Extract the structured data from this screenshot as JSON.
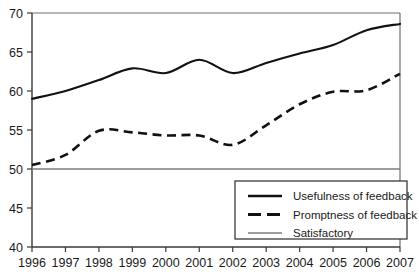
{
  "chart_data": {
    "type": "line",
    "title": "",
    "xlabel": "",
    "ylabel": "",
    "x": [
      1996,
      1997,
      1998,
      1999,
      2000,
      2001,
      2002,
      2003,
      2004,
      2005,
      2006,
      2007
    ],
    "xtick_labels": [
      "1996",
      "1997",
      "1998",
      "1999",
      "2000",
      "2001",
      "2002",
      "2003",
      "2004",
      "2005",
      "2006",
      "2007"
    ],
    "ytick_labels": [
      "40",
      "45",
      "50",
      "55",
      "60",
      "65",
      "70"
    ],
    "yticks": [
      40,
      45,
      50,
      55,
      60,
      65,
      70
    ],
    "ylim": [
      40,
      70
    ],
    "xlim": [
      1996,
      2007
    ],
    "grid": false,
    "legend_position": "bottom-right",
    "series": [
      {
        "name": "Usefulness of feedback",
        "style": "solid",
        "color": "#111111",
        "values": [
          59.0,
          60.0,
          61.4,
          62.9,
          62.3,
          64.0,
          62.3,
          63.6,
          64.8,
          65.9,
          67.8,
          68.6
        ]
      },
      {
        "name": "Promptness of feedback",
        "style": "dashed",
        "color": "#111111",
        "values": [
          50.5,
          51.8,
          54.9,
          54.7,
          54.3,
          54.3,
          53.1,
          55.6,
          58.3,
          59.9,
          60.1,
          62.2
        ]
      },
      {
        "name": "Satisfactory",
        "style": "reference",
        "color": "#7c7c7c",
        "values": [
          50,
          50,
          50,
          50,
          50,
          50,
          50,
          50,
          50,
          50,
          50,
          50
        ]
      }
    ]
  },
  "legend": {
    "entries": [
      {
        "label": "Usefulness of feedback",
        "style": "solid"
      },
      {
        "label": "Promptness of feedback",
        "style": "dashed"
      },
      {
        "label": "Satisfactory",
        "style": "reference"
      }
    ]
  }
}
